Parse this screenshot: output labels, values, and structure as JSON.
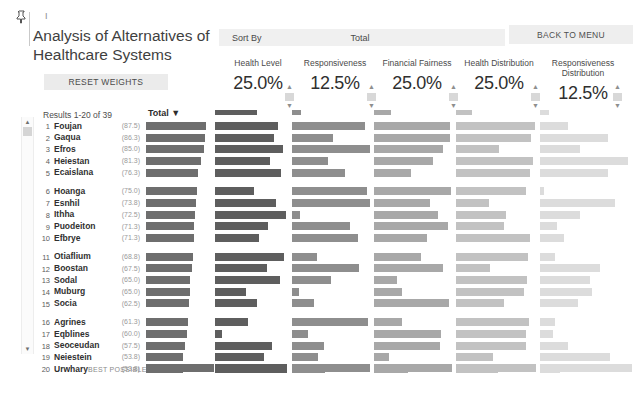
{
  "header": {
    "pin_icon": "pin-icon",
    "tick_mark": "I",
    "title": "Analysis of Alternatives of Healthcare Systems",
    "reset_button": "RESET WEIGHTS",
    "results_label": "Results 1-20 of 39",
    "sort_by_label": "Sort By",
    "sort_by_value": "Total",
    "back_to_menu": "BACK TO MENU",
    "total_column_header": "Total ▼",
    "best_possible_label": "BEST POSSIBLE"
  },
  "colors": {
    "bar_total": "#6e6e6e",
    "bar_health_level": "#5e5e5e",
    "bar_responsiveness": "#8e8e8e",
    "bar_financial_fairness": "#a8a8a8",
    "bar_health_distribution": "#c2c2c2",
    "bar_responsiveness_distribution": "#dcdcdc",
    "panel_background": "#ffffff",
    "button_background": "#ebebeb"
  },
  "criteria": [
    {
      "name": "Health Level",
      "weight": "25.0%"
    },
    {
      "name": "Responsiveness",
      "weight": "12.5%"
    },
    {
      "name": "Financial Fairness",
      "weight": "25.0%"
    },
    {
      "name": "Health Distribution",
      "weight": "25.0%"
    },
    {
      "name": "Responsiveness Distribution",
      "weight": "12.5%"
    }
  ],
  "chart_data": {
    "type": "bar",
    "title": "Analysis of Alternatives of Healthcare Systems",
    "xlabel": "",
    "ylabel": "",
    "xlim": [
      0,
      100
    ],
    "grid": false,
    "legend": "none",
    "categories": [
      "Foujan",
      "Gaqua",
      "Efros",
      "Heiestan",
      "Ecaislana",
      "Hoanga",
      "Esnhil",
      "Ithha",
      "Puodeiton",
      "Efbrye",
      "Otiaflium",
      "Boostan",
      "Sodal",
      "Muburg",
      "Socia",
      "Agrines",
      "Eqblines",
      "Seoceudan",
      "Neiestein",
      "Urwhary"
    ],
    "series": [
      {
        "name": "Total",
        "values": [
          87.5,
          86.3,
          85.0,
          81.3,
          76.3,
          75.0,
          73.8,
          72.5,
          71.3,
          71.3,
          68.8,
          67.5,
          65.0,
          65.0,
          62.5,
          61.3,
          60.0,
          57.5,
          53.8,
          53.8
        ]
      },
      {
        "name": "Health Level",
        "values": [
          88.0,
          82.0,
          95.0,
          76.0,
          92.0,
          54.0,
          85.0,
          99.0,
          74.0,
          61.0,
          96.0,
          72.0,
          90.0,
          43.0,
          58.0,
          46.0,
          10.0,
          79.0,
          68.0,
          100.0
        ]
      },
      {
        "name": "Responsiveness",
        "values": [
          94.0,
          52.0,
          100.0,
          46.0,
          68.0,
          96.0,
          112.0,
          10.0,
          74.0,
          84.0,
          32.0,
          86.0,
          50.0,
          9.0,
          28.0,
          97.0,
          20.0,
          41.0,
          33.0,
          42.0
        ]
      },
      {
        "name": "Financial Fairness",
        "values": [
          98.0,
          98.0,
          88.0,
          76.0,
          48.0,
          99.0,
          72.0,
          82.0,
          95.0,
          68.0,
          60.0,
          88.0,
          29.0,
          36.0,
          96.0,
          36.0,
          86.0,
          84.0,
          19.0,
          44.0
        ]
      },
      {
        "name": "Health Distribution",
        "values": [
          99.0,
          94.0,
          54.0,
          96.0,
          93.0,
          88.0,
          41.0,
          62.0,
          60.0,
          92.0,
          90.0,
          42.0,
          89.0,
          85.0,
          60.0,
          91.0,
          87.0,
          88.0,
          46.0,
          52.0
        ]
      },
      {
        "name": "Responsiveness Distribution",
        "values": [
          30.0,
          74.0,
          43.0,
          96.0,
          74.0,
          4.0,
          82.0,
          44.0,
          18.0,
          26.0,
          16.0,
          65.0,
          54.0,
          56.0,
          41.0,
          16.0,
          14.0,
          30.0,
          76.0,
          22.0
        ]
      }
    ],
    "best_possible": {
      "Total": 100.0,
      "Health Level": 100.0,
      "Responsiveness": 100.0,
      "Financial Fairness": 100.0,
      "Health Distribution": 100.0,
      "Responsiveness Distribution": 100.0
    }
  },
  "rows": [
    {
      "rank": "1",
      "name": "Foujan",
      "score": "(87.5)"
    },
    {
      "rank": "2",
      "name": "Gaqua",
      "score": "(86.3)"
    },
    {
      "rank": "3",
      "name": "Efros",
      "score": "(85.0)"
    },
    {
      "rank": "4",
      "name": "Heiestan",
      "score": "(81.3)"
    },
    {
      "rank": "5",
      "name": "Ecaislana",
      "score": "(76.3)"
    },
    {
      "rank": "6",
      "name": "Hoanga",
      "score": "(75.0)"
    },
    {
      "rank": "7",
      "name": "Esnhil",
      "score": "(73.8)"
    },
    {
      "rank": "8",
      "name": "Ithha",
      "score": "(72.5)"
    },
    {
      "rank": "9",
      "name": "Puodeiton",
      "score": "(71.3)"
    },
    {
      "rank": "10",
      "name": "Efbrye",
      "score": "(71.3)"
    },
    {
      "rank": "11",
      "name": "Otiaflium",
      "score": "(68.8)"
    },
    {
      "rank": "12",
      "name": "Boostan",
      "score": "(67.5)"
    },
    {
      "rank": "13",
      "name": "Sodal",
      "score": "(65.0)"
    },
    {
      "rank": "14",
      "name": "Muburg",
      "score": "(65.0)"
    },
    {
      "rank": "15",
      "name": "Socia",
      "score": "(62.5)"
    },
    {
      "rank": "16",
      "name": "Agrines",
      "score": "(61.3)"
    },
    {
      "rank": "17",
      "name": "Eqblines",
      "score": "(60.0)"
    },
    {
      "rank": "18",
      "name": "Seoceudan",
      "score": "(57.5)"
    },
    {
      "rank": "19",
      "name": "Neiestein",
      "score": "(53.8)"
    },
    {
      "rank": "20",
      "name": "Urwhary",
      "score": "(53.8)"
    }
  ],
  "scrollbar": {
    "up_arrow": "▲",
    "down_arrow": "▼"
  },
  "spinner": {
    "up_arrow": "▲",
    "down_arrow": "▼"
  }
}
